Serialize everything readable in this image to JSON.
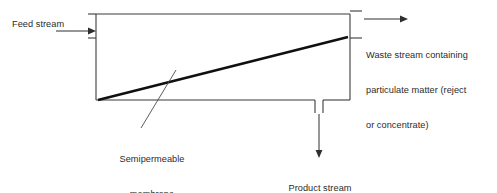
{
  "diagram": {
    "labels": {
      "feed_stream": "Feed stream",
      "waste_stream_line1": "Waste stream containing",
      "waste_stream_line2": "particulate matter (reject",
      "waste_stream_line3": "or concentrate)",
      "membrane_line1": "Semipermeable",
      "membrane_line2": "membrane",
      "product_stream_line1": "Product stream",
      "product_stream_line2": "(permeate)"
    },
    "colors": {
      "background": "#ffffff",
      "vessel_outline": "#3b3b3b",
      "membrane": "#101010",
      "arrow": "#2e2e2e",
      "text": "#2b2b2b"
    },
    "geometry": {
      "vessel_left": 96,
      "vessel_right": 350,
      "vessel_top": 14,
      "vessel_bottom": 100,
      "membrane_start_x": 98,
      "membrane_start_y": 100,
      "membrane_end_x": 348,
      "membrane_end_y": 37,
      "feed_arrow_y": 31,
      "waste_arrow_y": 19,
      "product_nozzle_left_x": 315,
      "product_nozzle_right_x": 323,
      "product_arrow_x": 319
    }
  }
}
